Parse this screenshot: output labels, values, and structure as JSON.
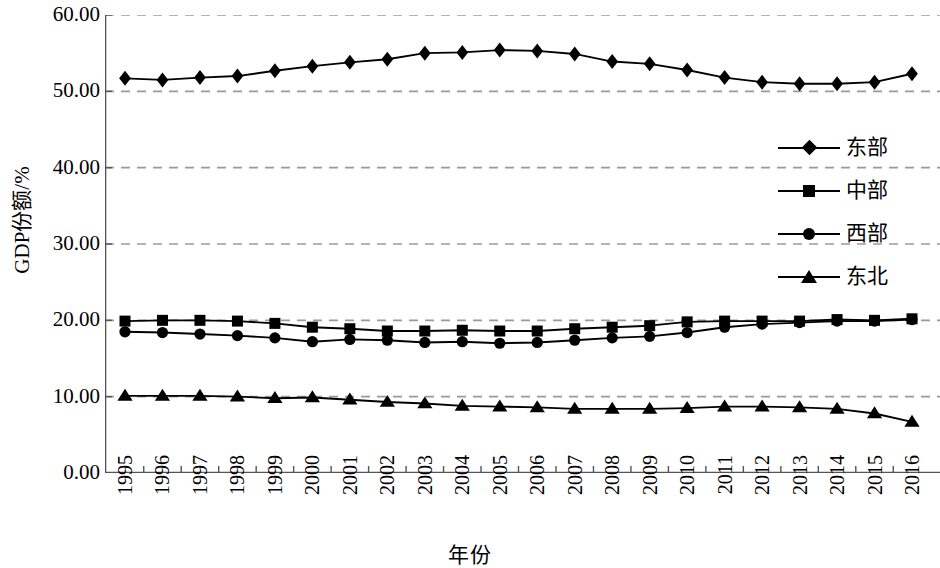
{
  "chart_data": {
    "type": "line",
    "title": "",
    "xlabel": "年份",
    "ylabel": "GDP份额/%",
    "x": [
      1995,
      1996,
      1997,
      1998,
      1999,
      2000,
      2001,
      2002,
      2003,
      2004,
      2005,
      2006,
      2007,
      2008,
      2009,
      2010,
      2011,
      2012,
      2013,
      2014,
      2015,
      2016
    ],
    "categories": [
      "1995",
      "1996",
      "1997",
      "1998",
      "1999",
      "2000",
      "2001",
      "2002",
      "2003",
      "2004",
      "2005",
      "2006",
      "2007",
      "2008",
      "2009",
      "2010",
      "2011",
      "2012",
      "2013",
      "2014",
      "2015",
      "2016"
    ],
    "ylim": [
      0,
      60
    ],
    "yticks": [
      0,
      10,
      20,
      30,
      40,
      50,
      60
    ],
    "ytick_labels": [
      "0.00",
      "10.00",
      "20.00",
      "30.00",
      "40.00",
      "50.00",
      "60.00"
    ],
    "grid": true,
    "grid_style": "dashed-horizontal",
    "legend_position": "right-middle",
    "series": [
      {
        "name": "东部",
        "marker": "diamond",
        "values": [
          51.7,
          51.5,
          51.8,
          52.0,
          52.7,
          53.3,
          53.8,
          54.2,
          55.0,
          55.1,
          55.4,
          55.3,
          54.9,
          53.9,
          53.6,
          52.8,
          51.8,
          51.2,
          51.0,
          51.0,
          51.2,
          52.3
        ]
      },
      {
        "name": "中部",
        "marker": "square",
        "values": [
          19.9,
          20.0,
          20.0,
          19.9,
          19.6,
          19.1,
          18.9,
          18.6,
          18.6,
          18.7,
          18.6,
          18.6,
          18.9,
          19.1,
          19.3,
          19.8,
          19.9,
          19.9,
          19.9,
          20.1,
          20.0,
          20.2
        ]
      },
      {
        "name": "西部",
        "marker": "circle",
        "values": [
          18.5,
          18.4,
          18.2,
          18.0,
          17.7,
          17.2,
          17.5,
          17.4,
          17.1,
          17.2,
          17.0,
          17.1,
          17.4,
          17.7,
          17.9,
          18.4,
          19.1,
          19.5,
          19.7,
          19.9,
          19.9,
          20.1
        ]
      },
      {
        "name": "东北",
        "marker": "triangle",
        "values": [
          10.1,
          10.1,
          10.1,
          10.0,
          9.8,
          9.9,
          9.6,
          9.3,
          9.1,
          8.8,
          8.7,
          8.6,
          8.4,
          8.4,
          8.4,
          8.5,
          8.7,
          8.7,
          8.6,
          8.4,
          7.8,
          6.7
        ]
      }
    ],
    "colors": {
      "series_line": "#000000",
      "marker": "#000000",
      "grid": "#9a9a9a",
      "axis": "#555555",
      "background": "#ffffff"
    }
  }
}
